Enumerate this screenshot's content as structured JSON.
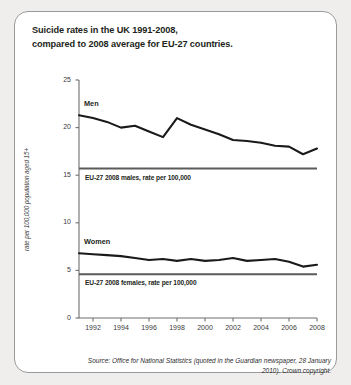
{
  "title": {
    "line1": "Suicide rates in the UK 1991-2008,",
    "line2": "compared to 2008 average for EU-27 countries."
  },
  "source": {
    "line1": "Source: Office for National Statistics (quoted in the",
    "line2": "Guardian newspaper, 28 January 2010). Crown copyright."
  },
  "colors": {
    "line": "#1a1a1a",
    "reference_line": "#5b5b5b",
    "axis": "#6f6f6f",
    "background": "#ffffff",
    "page": "#efeeec"
  },
  "chart_data": {
    "type": "line",
    "title": "Suicide rates in the UK 1991-2008, compared to 2008 average for EU-27 countries.",
    "xlabel": "",
    "ylabel": "rate per 100,000 population aged 15+",
    "xlim": [
      1991,
      2008
    ],
    "ylim": [
      0,
      25
    ],
    "yticks": [
      0,
      5,
      10,
      15,
      20,
      25
    ],
    "xticks": [
      1992,
      1994,
      1996,
      1998,
      2000,
      2002,
      2004,
      2006,
      2008
    ],
    "grid": false,
    "legend": "inline-labels",
    "x": [
      1991,
      1992,
      1993,
      1994,
      1995,
      1996,
      1997,
      1998,
      1999,
      2000,
      2001,
      2002,
      2003,
      2004,
      2005,
      2006,
      2007,
      2008
    ],
    "series": [
      {
        "name": "Men",
        "label": "Men",
        "values": [
          21.3,
          21.0,
          20.6,
          20.0,
          20.2,
          19.6,
          19.0,
          21.0,
          20.3,
          19.8,
          19.3,
          18.7,
          18.6,
          18.4,
          18.1,
          18.0,
          17.2,
          17.8
        ]
      },
      {
        "name": "Women",
        "label": "Women",
        "values": [
          6.8,
          6.7,
          6.6,
          6.5,
          6.3,
          6.1,
          6.2,
          6.0,
          6.2,
          6.0,
          6.1,
          6.3,
          6.0,
          6.1,
          6.2,
          5.9,
          5.4,
          5.6
        ]
      }
    ],
    "reference_lines": [
      {
        "name": "eu27-males",
        "label": "EU-27 2008 males, rate per 100,000",
        "value": 15.7
      },
      {
        "name": "eu27-females",
        "label": "EU-27 2008 females, rate per 100,000",
        "value": 4.6
      }
    ]
  }
}
